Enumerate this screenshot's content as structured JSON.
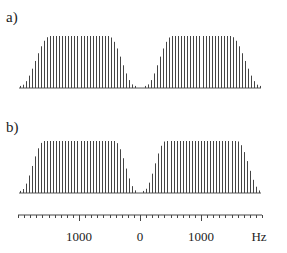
{
  "chart_data": [
    {
      "type": "bar",
      "panel_label": "a)",
      "title": "",
      "xlabel": "Hz",
      "ylabel": "",
      "description": "Two-sided line spectrum: two flat-topped bands of equally spaced spectral lines with gradual roll-off at outer edges and a wide gradual gap around 0 Hz",
      "line_spacing_hz": 50,
      "xlim": [
        -2000,
        2000
      ],
      "ylim": [
        0,
        1
      ],
      "bands": [
        {
          "name": "negative-band",
          "x_start": -1975,
          "x_end": -75,
          "rise": [
            -1975,
            -1475
          ],
          "fall": [
            -525,
            -75
          ]
        },
        {
          "name": "positive-band",
          "x_start": 75,
          "x_end": 1975,
          "rise": [
            75,
            525
          ],
          "fall": [
            1475,
            1975
          ]
        }
      ],
      "edge_shape": "raised-cosine"
    },
    {
      "type": "bar",
      "panel_label": "b)",
      "title": "",
      "xlabel": "Hz",
      "ylabel": "",
      "description": "Two-sided line spectrum: two flat-topped bands of equally spaced spectral lines with a steeper roll-off and narrower gap around 0 Hz",
      "line_spacing_hz": 50,
      "xlim": [
        -2000,
        2000
      ],
      "ylim": [
        0,
        1
      ],
      "bands": [
        {
          "name": "negative-band",
          "x_start": -1975,
          "x_end": -50,
          "rise": [
            -1975,
            -1575
          ],
          "fall": [
            -425,
            -50
          ]
        },
        {
          "name": "positive-band",
          "x_start": 50,
          "x_end": 1975,
          "rise": [
            50,
            425
          ],
          "fall": [
            1575,
            1975
          ]
        }
      ],
      "edge_shape": "raised-cosine"
    }
  ],
  "axis": {
    "unit_label": "Hz",
    "range": [
      -2000,
      2000
    ],
    "major_ticks": [
      {
        "value": -1000,
        "label": "1000"
      },
      {
        "value": 0,
        "label": "0"
      },
      {
        "value": 1000,
        "label": "1000"
      }
    ],
    "minor_tick_step": 100
  },
  "colors": {
    "lines": "#444444",
    "text": "#222222",
    "background": "#ffffff"
  }
}
